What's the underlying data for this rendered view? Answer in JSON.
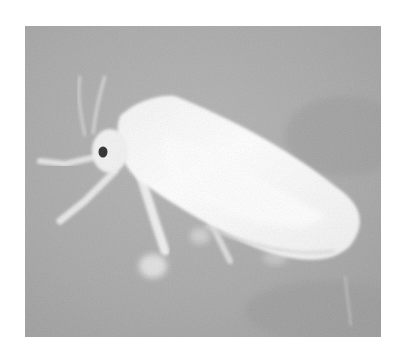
{
  "image": {
    "subject": "whitefly insect on leaf",
    "description": "Grayscale close-up photograph of a white-winged whitefly perched on a leaf surface",
    "colors": {
      "background_gray": "#a9a9a9",
      "background_dark": "#9a9a9a",
      "wing_white": "#ffffff",
      "leg_light": "#e8e8e8",
      "eye_dark": "#2a2a2a",
      "page_background": "#ffffff"
    }
  }
}
